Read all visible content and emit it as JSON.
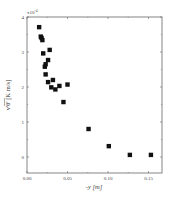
{
  "chart_data": {
    "type": "scatter",
    "title": "",
    "xlabel": "-y [m]",
    "ylabel": "v'θ' [K m/s]",
    "y_multiplier": "x10",
    "y_multiplier_exp": "-4",
    "xlim": [
      0.0,
      0.165
    ],
    "ylim": [
      -0.45,
      4.0
    ],
    "x_ticks": [
      0.0,
      0.05,
      0.1,
      0.15
    ],
    "x_tick_labels": [
      "0.00",
      "0.05",
      "0.10",
      "0.15"
    ],
    "y_ticks": [
      0,
      1,
      2,
      3,
      4
    ],
    "y_tick_labels": [
      "0",
      "1",
      "2",
      "3",
      "4"
    ],
    "grid": false,
    "legend": null,
    "marker": "filled-square",
    "marker_color": "#111111",
    "series": [
      {
        "name": "data",
        "points": [
          {
            "x": 0.015,
            "y": 3.71
          },
          {
            "x": 0.017,
            "y": 3.44
          },
          {
            "x": 0.018,
            "y": 3.4
          },
          {
            "x": 0.019,
            "y": 3.34
          },
          {
            "x": 0.02,
            "y": 2.96
          },
          {
            "x": 0.028,
            "y": 3.06
          },
          {
            "x": 0.026,
            "y": 2.77
          },
          {
            "x": 0.022,
            "y": 2.58
          },
          {
            "x": 0.023,
            "y": 2.65
          },
          {
            "x": 0.023,
            "y": 2.36
          },
          {
            "x": 0.026,
            "y": 2.14
          },
          {
            "x": 0.032,
            "y": 2.2
          },
          {
            "x": 0.03,
            "y": 1.99
          },
          {
            "x": 0.035,
            "y": 1.93
          },
          {
            "x": 0.04,
            "y": 2.03
          },
          {
            "x": 0.05,
            "y": 2.07
          },
          {
            "x": 0.045,
            "y": 1.57
          },
          {
            "x": 0.076,
            "y": 0.8
          },
          {
            "x": 0.101,
            "y": 0.31
          },
          {
            "x": 0.127,
            "y": 0.06
          },
          {
            "x": 0.153,
            "y": 0.06
          }
        ]
      }
    ]
  },
  "labels": {
    "xlabel": "-y [m]",
    "ylabel": "v'θ' [K m/s]",
    "multiplier": "x10",
    "multiplier_exp": "-4"
  }
}
